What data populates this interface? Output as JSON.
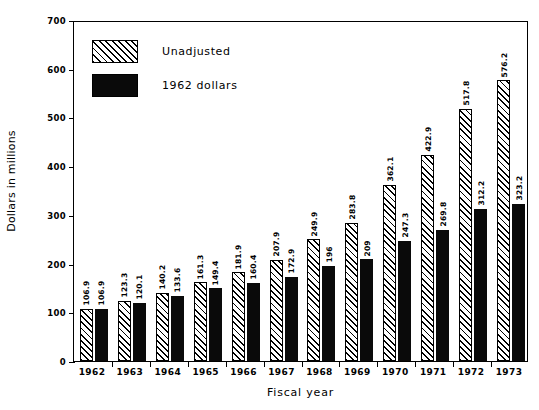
{
  "chart_data": {
    "type": "bar",
    "title": "",
    "xlabel": "Fiscal year",
    "ylabel": "Dollars in millions",
    "ylim": [
      0,
      700
    ],
    "yticks": [
      0,
      100,
      200,
      300,
      400,
      500,
      600,
      700
    ],
    "ytick_labels": [
      "0",
      "100",
      "200",
      "300",
      "400",
      "500",
      "600",
      "700"
    ],
    "grid": false,
    "legend_position": "top-left-inside",
    "categories": [
      "1962",
      "1963",
      "1964",
      "1965",
      "1966",
      "1967",
      "1968",
      "1969",
      "1970",
      "1971",
      "1972",
      "1973"
    ],
    "series": [
      {
        "name": "Unadjusted",
        "style": "hatched",
        "color": "#000000",
        "values": [
          106.9,
          123.3,
          140.2,
          161.3,
          181.9,
          207.9,
          249.9,
          283.8,
          362.1,
          422.9,
          517.8,
          576.2
        ],
        "labels": [
          "106.9",
          "123.3",
          "140.2",
          "161.3",
          "181.9",
          "207.9",
          "249.9",
          "283.8",
          "362.1",
          "422.9",
          "517.8",
          "576.2"
        ]
      },
      {
        "name": "1962 dollars",
        "style": "solid",
        "color": "#0a0a0a",
        "values": [
          106.9,
          120.1,
          133.6,
          149.4,
          160.4,
          172.9,
          196,
          209,
          247.3,
          269.8,
          312.2,
          323.2
        ],
        "labels": [
          "106.9",
          "120.1",
          "133.6",
          "149.4",
          "160.4",
          "172.9",
          "196",
          "209",
          "247.3",
          "269.8",
          "312.2",
          "323.2"
        ]
      }
    ]
  },
  "legend": {
    "items": [
      {
        "label": "Unadjusted",
        "swatch": "hatched"
      },
      {
        "label": "1962  dollars",
        "swatch": "solid"
      }
    ]
  },
  "axes": {
    "y_title": "Dollars in millions",
    "x_title": "Fiscal year"
  }
}
